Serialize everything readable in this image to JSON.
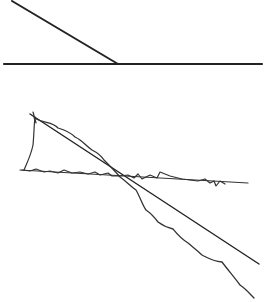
{
  "canvas": {
    "width": 264,
    "height": 302,
    "background": "#ffffff"
  },
  "colors": {
    "ink": "#222222",
    "ink_light": "#333333"
  },
  "figure_top": {
    "description": "A straight slanted line meeting a horizontal baseline",
    "baseline": {
      "x1": 4,
      "y1": 64,
      "x2": 262,
      "y2": 64,
      "width": 2.2
    },
    "slant": {
      "x1": 12,
      "y1": 1,
      "x2": 118,
      "y2": 64,
      "width": 2
    }
  },
  "figure_bottom": {
    "description": "Hand-drawn trace of two crossing lines: a straight reference line and a jittery traced copy",
    "reference_line": {
      "x1": 30,
      "y1": 114,
      "x2": 259,
      "y2": 264,
      "width": 1.4
    },
    "horizontal_line": {
      "x1": 20,
      "y1": 170,
      "x2": 248,
      "y2": 183,
      "width": 1.2
    },
    "traced_descending": "M34 118 C45 124 52 121 58 128 C65 130 70 132 75 137 C82 140 85 145 92 150 C96 152 100 154 104 160 C110 166 114 170 120 177 C126 181 130 186 136 190 C140 197 143 206 146 210 C152 214 155 218 158 222 C162 225 165 227 173 229 C177 234 180 238 188 243 C194 248 198 251 202 255 C208 258 212 261 222 262 C228 270 235 278 240 285 C246 289 250 294 254 298",
    "traced_horizontal": "M22 170 L30 171 L36 169 L44 172 L50 171 L58 173 L64 170 L72 173 L80 172 L88 174 L95 172 L100 175 L108 173 L112 176 L120 176 L128 175 L134 178 L138 174 L142 179 L150 175 L157 178 L160 172 L170 176 L182 179 L190 180 L198 181 L205 179 L210 183 L214 181 L216 186 L220 181 L225 184",
    "traced_left_side": "M35 117 C34 125 34 135 33 145 C31 155 27 163 24 170",
    "tick_top": "M33 112 L36 123"
  }
}
